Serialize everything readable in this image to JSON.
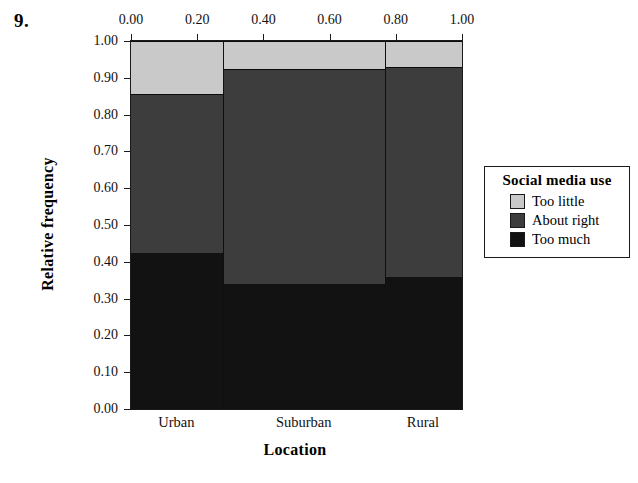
{
  "figure": {
    "number": "9."
  },
  "chart_data": {
    "type": "bar",
    "subtype": "mosaic-stacked-relative-frequency",
    "title": "",
    "xlabel": "Location",
    "ylabel": "Relative frequency",
    "categories": [
      "Urban",
      "Suburban",
      "Rural"
    ],
    "category_widths": [
      0.28,
      0.49,
      0.23
    ],
    "category_centers": [
      0.14,
      0.525,
      0.885
    ],
    "series": [
      {
        "name": "Too little",
        "color": "#c9c9c9",
        "values": [
          0.145,
          0.075,
          0.07
        ]
      },
      {
        "name": "About right",
        "color": "#3d3d3d",
        "values": [
          0.43,
          0.585,
          0.57
        ]
      },
      {
        "name": "Too much",
        "color": "#121212",
        "values": [
          0.425,
          0.34,
          0.36
        ]
      }
    ],
    "stack_order_bottom_to_top": [
      "Too much",
      "About right",
      "Too little"
    ],
    "cumulative_boundaries": {
      "Urban": [
        0.425,
        0.855,
        1.0
      ],
      "Suburban": [
        0.34,
        0.925,
        1.0
      ],
      "Rural": [
        0.36,
        0.93,
        1.0
      ]
    },
    "ylim": [
      0.0,
      1.0
    ],
    "xlim": [
      0.0,
      1.0
    ],
    "grid": false,
    "legend_position": "right"
  },
  "axes": {
    "x_top": {
      "ticks": [
        0.0,
        0.2,
        0.4,
        0.6,
        0.8,
        1.0
      ],
      "tick_labels": [
        "0.00",
        "0.20",
        "0.40",
        "0.60",
        "0.80",
        "1.00"
      ],
      "position": "top"
    },
    "y_left": {
      "ticks": [
        0.0,
        0.1,
        0.2,
        0.3,
        0.4,
        0.5,
        0.6,
        0.7,
        0.8,
        0.9,
        1.0
      ],
      "tick_labels": [
        "0.00",
        "0.10",
        "0.20",
        "0.30",
        "0.40",
        "0.50",
        "0.60",
        "0.70",
        "0.80",
        "0.90",
        "1.00"
      ],
      "title": "Relative frequency",
      "position": "left"
    },
    "x_bottom": {
      "title": "Location",
      "category_labels": [
        "Urban",
        "Suburban",
        "Rural"
      ]
    }
  },
  "legend": {
    "title": "Social media use",
    "items": [
      {
        "label": "Too little",
        "color": "#c9c9c9"
      },
      {
        "label": "About right",
        "color": "#3d3d3d"
      },
      {
        "label": "Too much",
        "color": "#121212"
      }
    ]
  },
  "colors": {
    "too_little": "#c9c9c9",
    "about_right": "#3d3d3d",
    "too_much": "#121212",
    "axis": "#1a1a1a",
    "background": "#ffffff"
  }
}
